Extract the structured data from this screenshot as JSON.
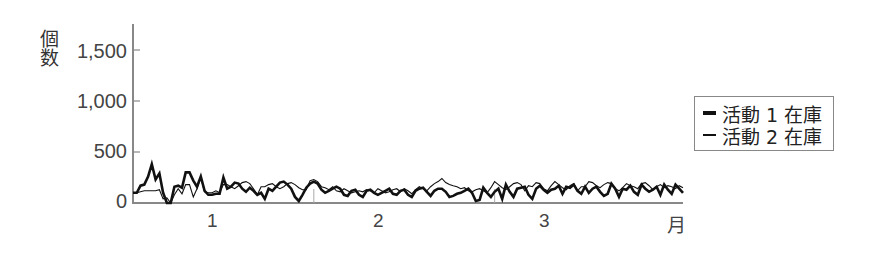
{
  "chart_data": {
    "type": "line",
    "title": "",
    "xlabel": "月",
    "ylabel": "個数",
    "ylim": [
      0,
      1750
    ],
    "yticks": [
      0,
      500,
      1000,
      1500
    ],
    "ytick_labels": [
      "0",
      "500",
      "1,000",
      "1,500"
    ],
    "xtick_labels": [
      "1",
      "2",
      "3",
      "月"
    ],
    "month_boundaries_index": [
      33,
      66
    ],
    "grid": false,
    "legend_position": "right",
    "series": [
      {
        "name": "活動 1 在庫",
        "style": "thick",
        "values": [
          100,
          100,
          170,
          180,
          260,
          380,
          230,
          290,
          100,
          0,
          0,
          160,
          170,
          150,
          300,
          300,
          220,
          160,
          260,
          120,
          80,
          80,
          90,
          90,
          250,
          140,
          160,
          200,
          190,
          140,
          110,
          150,
          120,
          80,
          100,
          40,
          140,
          120,
          160,
          200,
          210,
          180,
          140,
          60,
          20,
          80,
          150,
          190,
          210,
          190,
          130,
          100,
          120,
          140,
          160,
          140,
          80,
          70,
          120,
          130,
          80,
          60,
          120,
          130,
          100,
          80,
          100,
          120,
          140,
          90,
          80,
          120,
          130,
          80,
          60,
          120,
          140,
          150,
          110,
          70,
          120,
          140,
          140,
          110,
          60,
          70,
          90,
          100,
          120,
          140,
          100,
          20,
          30,
          150,
          100,
          60,
          110,
          140,
          40,
          180,
          110,
          60,
          140,
          150,
          160,
          80,
          40,
          140,
          170,
          130,
          100,
          130,
          140,
          170,
          90,
          160,
          150,
          180,
          120,
          90,
          160,
          100,
          140,
          160,
          110,
          70,
          90,
          190,
          140,
          60,
          140,
          130,
          170,
          110,
          80,
          180,
          140,
          110,
          130,
          160,
          80,
          180,
          130,
          90,
          180,
          140,
          100
        ]
      },
      {
        "name": "活動 2 在庫",
        "style": "thin",
        "values": [
          100,
          100,
          110,
          120,
          120,
          120,
          120,
          130,
          40,
          50,
          0,
          80,
          140,
          90,
          180,
          180,
          60,
          140,
          250,
          110,
          100,
          100,
          120,
          100,
          180,
          180,
          160,
          140,
          170,
          200,
          210,
          190,
          140,
          80,
          160,
          160,
          180,
          190,
          160,
          140,
          160,
          190,
          200,
          180,
          150,
          130,
          130,
          220,
          230,
          210,
          160,
          150,
          130,
          160,
          120,
          110,
          140,
          120,
          100,
          110,
          120,
          110,
          130,
          120,
          100,
          140,
          120,
          100,
          110,
          130,
          140,
          110,
          140,
          120,
          90,
          130,
          160,
          140,
          120,
          160,
          190,
          210,
          240,
          200,
          180,
          170,
          160,
          140,
          150,
          120,
          110,
          130,
          140,
          120,
          100,
          150,
          210,
          180,
          150,
          130,
          160,
          190,
          200,
          180,
          120,
          170,
          160,
          200,
          190,
          140,
          120,
          170,
          210,
          180,
          150,
          130,
          170,
          190,
          120,
          160,
          160,
          210,
          200,
          170,
          150,
          180,
          200,
          190,
          140,
          120,
          150,
          190,
          170,
          160,
          140,
          190,
          200,
          170,
          130,
          160,
          180,
          150,
          170,
          160,
          140,
          170,
          150
        ]
      }
    ]
  },
  "axes": {
    "ylabel_chars": [
      "個",
      "数"
    ],
    "yticks": [
      {
        "label": "1,500",
        "value": 1500
      },
      {
        "label": "1,000",
        "value": 1000
      },
      {
        "label": "500",
        "value": 500
      },
      {
        "label": "0",
        "value": 0
      }
    ],
    "xticks": [
      {
        "label": "1"
      },
      {
        "label": "2"
      },
      {
        "label": "3"
      },
      {
        "label": "月"
      }
    ]
  },
  "legend": {
    "items": [
      {
        "label": "活動 1 在庫",
        "weight": "thick"
      },
      {
        "label": "活動 2 在庫",
        "weight": "thin"
      }
    ]
  },
  "colors": {
    "line": "#111111",
    "axis": "#888888",
    "text": "#444444",
    "background": "#ffffff"
  }
}
